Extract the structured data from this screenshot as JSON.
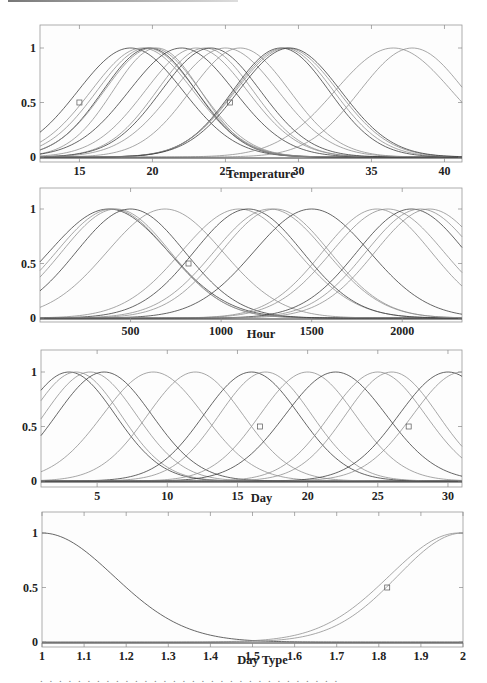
{
  "colors": {
    "curve_dark": "#333333",
    "curve_light": "#8a8a8a",
    "axis": "#9a9a9a",
    "text": "#222222"
  },
  "chart_data": [
    {
      "type": "line",
      "title": "",
      "xlabel": "Temperature",
      "ylabel": "",
      "xlim": [
        12.3,
        41.2
      ],
      "ylim": [
        -0.02,
        1.2
      ],
      "xticks": [
        15,
        20,
        25,
        30,
        35,
        40
      ],
      "yticks": [
        0,
        0.5,
        1
      ],
      "xtick_labels": [
        "15",
        "20",
        "25",
        "30",
        "35",
        "40"
      ],
      "ytick_labels": [
        "0",
        "0.5",
        "1"
      ],
      "grid": false,
      "legend": "none",
      "description": "Gaussian membership functions (height 1) over temperature",
      "series": [
        {
          "name": "mf1",
          "center": 18.5,
          "sigma": 3.6
        },
        {
          "name": "mf2",
          "center": 19.3,
          "sigma": 3.5
        },
        {
          "name": "mf3",
          "center": 19.6,
          "sigma": 3.4
        },
        {
          "name": "mf4",
          "center": 19.8,
          "sigma": 3.2
        },
        {
          "name": "mf5",
          "center": 20.0,
          "sigma": 3.3
        },
        {
          "name": "mf6",
          "center": 20.3,
          "sigma": 3.0
        },
        {
          "name": "mf7",
          "center": 22.0,
          "sigma": 3.6
        },
        {
          "name": "mf8",
          "center": 23.0,
          "sigma": 3.5
        },
        {
          "name": "mf9",
          "center": 23.6,
          "sigma": 3.3
        },
        {
          "name": "mf10",
          "center": 24.0,
          "sigma": 3.4
        },
        {
          "name": "mf11",
          "center": 25.0,
          "sigma": 3.6
        },
        {
          "name": "mf12",
          "center": 26.0,
          "sigma": 3.4
        },
        {
          "name": "mf13",
          "center": 28.8,
          "sigma": 3.3
        },
        {
          "name": "mf14",
          "center": 29.0,
          "sigma": 3.4
        },
        {
          "name": "mf15",
          "center": 29.2,
          "sigma": 3.5
        },
        {
          "name": "mf16",
          "center": 29.4,
          "sigma": 3.5
        },
        {
          "name": "mf17",
          "center": 36.5,
          "sigma": 4.0
        },
        {
          "name": "mf18",
          "center": 37.8,
          "sigma": 3.6
        }
      ],
      "markers": [
        {
          "x": 15.0,
          "y": 0.5
        },
        {
          "x": 25.3,
          "y": 0.5
        }
      ]
    },
    {
      "type": "line",
      "title": "",
      "xlabel": "Hour",
      "ylabel": "",
      "xlim": [
        0,
        2330
      ],
      "ylim": [
        -0.02,
        1.2
      ],
      "xticks": [
        500,
        1000,
        1500,
        2000
      ],
      "yticks": [
        0,
        0.5,
        1
      ],
      "xtick_labels": [
        "500",
        "1000",
        "1500",
        "2000"
      ],
      "ytick_labels": [
        "0",
        "0.5",
        "1"
      ],
      "grid": false,
      "legend": "none",
      "description": "Gaussian membership functions (height 1) over hour",
      "series": [
        {
          "name": "mf1",
          "center": 380,
          "sigma": 330
        },
        {
          "name": "mf2",
          "center": 400,
          "sigma": 310
        },
        {
          "name": "mf3",
          "center": 420,
          "sigma": 300
        },
        {
          "name": "mf4",
          "center": 500,
          "sigma": 300
        },
        {
          "name": "mf5",
          "center": 690,
          "sigma": 320
        },
        {
          "name": "mf6",
          "center": 1100,
          "sigma": 320
        },
        {
          "name": "mf7",
          "center": 1150,
          "sigma": 300
        },
        {
          "name": "mf8",
          "center": 1270,
          "sigma": 310
        },
        {
          "name": "mf9",
          "center": 1300,
          "sigma": 300
        },
        {
          "name": "mf10",
          "center": 1500,
          "sigma": 320
        },
        {
          "name": "mf11",
          "center": 1860,
          "sigma": 300
        },
        {
          "name": "mf12",
          "center": 1920,
          "sigma": 310
        },
        {
          "name": "mf13",
          "center": 2050,
          "sigma": 300
        },
        {
          "name": "mf14",
          "center": 2100,
          "sigma": 300
        },
        {
          "name": "mf15",
          "center": 2150,
          "sigma": 300
        }
      ],
      "markers": [
        {
          "x": 820,
          "y": 0.5
        }
      ]
    },
    {
      "type": "line",
      "title": "",
      "xlabel": "Day",
      "ylabel": "",
      "xlim": [
        1,
        31
      ],
      "ylim": [
        -0.02,
        1.2
      ],
      "xticks": [
        5,
        10,
        15,
        20,
        25,
        30
      ],
      "yticks": [
        0,
        0.5,
        1
      ],
      "xtick_labels": [
        "5",
        "10",
        "15",
        "20",
        "25",
        "30"
      ],
      "ytick_labels": [
        "0",
        "0.5",
        "1"
      ],
      "grid": false,
      "legend": "none",
      "description": "Gaussian membership functions (height 1) over day of month",
      "series": [
        {
          "name": "mf1",
          "center": 3.0,
          "sigma": 3.3
        },
        {
          "name": "mf2",
          "center": 3.5,
          "sigma": 3.2
        },
        {
          "name": "mf3",
          "center": 4.5,
          "sigma": 3.3
        },
        {
          "name": "mf4",
          "center": 5.5,
          "sigma": 3.4
        },
        {
          "name": "mf5",
          "center": 9.0,
          "sigma": 3.6
        },
        {
          "name": "mf6",
          "center": 12.0,
          "sigma": 3.4
        },
        {
          "name": "mf7",
          "center": 16.0,
          "sigma": 3.4
        },
        {
          "name": "mf8",
          "center": 17.0,
          "sigma": 3.3
        },
        {
          "name": "mf9",
          "center": 20.0,
          "sigma": 3.4
        },
        {
          "name": "mf10",
          "center": 22.0,
          "sigma": 3.6
        },
        {
          "name": "mf11",
          "center": 25.0,
          "sigma": 3.4
        },
        {
          "name": "mf12",
          "center": 26.0,
          "sigma": 3.3
        },
        {
          "name": "mf13",
          "center": 30.0,
          "sigma": 3.5
        },
        {
          "name": "mf14",
          "center": 31.0,
          "sigma": 3.5
        }
      ],
      "markers": [
        {
          "x": 16.6,
          "y": 0.5
        },
        {
          "x": 27.2,
          "y": 0.5
        }
      ]
    },
    {
      "type": "line",
      "title": "",
      "xlabel": "Day Type",
      "ylabel": "",
      "xlim": [
        1,
        2
      ],
      "ylim": [
        -0.02,
        1.2
      ],
      "xticks": [
        1,
        1.1,
        1.2,
        1.3,
        1.4,
        1.5,
        1.6,
        1.7,
        1.8,
        1.9,
        2
      ],
      "yticks": [
        0,
        0.5,
        1
      ],
      "xtick_labels": [
        "1",
        "1.1",
        "1.2",
        "1.3",
        "1.4",
        "1.5",
        "1.6",
        "1.7",
        "1.8",
        "1.9",
        "2"
      ],
      "ytick_labels": [
        "0",
        "0.5",
        "1"
      ],
      "grid": false,
      "legend": "none",
      "description": "Gaussian membership functions over day type (1 = weekday, 2 = weekend)",
      "series": [
        {
          "name": "mf1",
          "center": 1.0,
          "sigma": 0.17
        },
        {
          "name": "mf2",
          "center": 1.99,
          "sigma": 0.165
        },
        {
          "name": "mf3",
          "center": 2.0,
          "sigma": 0.155
        }
      ],
      "markers": [
        {
          "x": 1.82,
          "y": 0.5
        }
      ]
    }
  ]
}
